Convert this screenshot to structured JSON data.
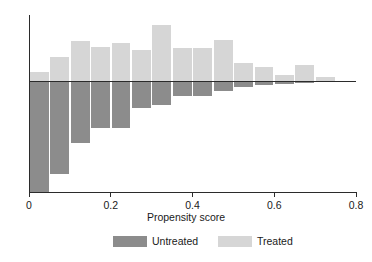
{
  "chart_data": {
    "type": "bar",
    "title": "",
    "subtitle": "",
    "xlabel": "Propensity score",
    "ylabel": "",
    "xlim": [
      0,
      0.8
    ],
    "xticks": [
      0,
      0.2,
      0.4,
      0.6,
      0.8
    ],
    "xtick_labels": [
      "0",
      "0.2",
      "0.4",
      "0.6",
      "0.8"
    ],
    "yticks": [],
    "ytick_labels": [],
    "grid": false,
    "orientation": "back-to-back-histogram",
    "bin_width": 0.05,
    "bin_starts": [
      0.0,
      0.05,
      0.1,
      0.15,
      0.2,
      0.25,
      0.3,
      0.35,
      0.4,
      0.45,
      0.5,
      0.55,
      0.6,
      0.65,
      0.7
    ],
    "bin_centers": [
      0.025,
      0.075,
      0.125,
      0.175,
      0.225,
      0.275,
      0.325,
      0.375,
      0.425,
      0.475,
      0.525,
      0.575,
      0.625,
      0.675,
      0.725
    ],
    "categories": [
      "0.00-0.05",
      "0.05-0.10",
      "0.10-0.15",
      "0.15-0.20",
      "0.20-0.25",
      "0.25-0.30",
      "0.30-0.35",
      "0.35-0.40",
      "0.40-0.45",
      "0.45-0.50",
      "0.50-0.55",
      "0.55-0.60",
      "0.60-0.65",
      "0.65-0.70",
      "0.70-0.75"
    ],
    "series": [
      {
        "name": "Treated",
        "color": "#d6d6d6",
        "direction": "up",
        "values": [
          9,
          24,
          40,
          34,
          38,
          31,
          56,
          33,
          33,
          41,
          18,
          14,
          6,
          16,
          4
        ]
      },
      {
        "name": "Untreated",
        "color": "#8c8c8c",
        "direction": "down",
        "values": [
          111,
          93,
          62,
          47,
          47,
          27,
          24,
          15,
          15,
          10,
          6,
          4,
          3,
          2,
          1
        ]
      }
    ],
    "legend": {
      "position": "bottom",
      "entries": [
        {
          "label": "Untreated",
          "color": "#8c8c8c"
        },
        {
          "label": "Treated",
          "color": "#d6d6d6"
        }
      ]
    },
    "axis_color": "#2b2b2b",
    "background": "#ffffff"
  }
}
